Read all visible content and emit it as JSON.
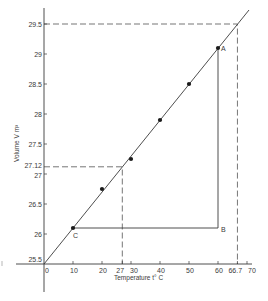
{
  "chart_data": {
    "type": "scatter",
    "title": "",
    "xlabel": "Temperature t° C",
    "ylabel": "Volume V m³",
    "xlim": [
      0,
      70
    ],
    "ylim": [
      25.5,
      29.5
    ],
    "grid": false,
    "legend": null,
    "x_ticks": [
      "0",
      "10",
      "20",
      "27",
      "30",
      "40",
      "50",
      "60",
      "66.7",
      "70"
    ],
    "x_tick_values": [
      0,
      10,
      20,
      27,
      30,
      40,
      50,
      60,
      66.7,
      70
    ],
    "y_ticks": [
      "25.5",
      "26",
      "26.5",
      "27",
      "27.12",
      "27.5",
      "28",
      "28.5",
      "29",
      "29.5"
    ],
    "y_tick_values": [
      25.5,
      26,
      26.5,
      27,
      27.12,
      27.5,
      28,
      28.5,
      29,
      29.5
    ],
    "series": [
      {
        "name": "Measured points",
        "x": [
          10,
          20,
          30,
          40,
          50,
          60
        ],
        "y": [
          26.1,
          26.75,
          27.25,
          27.9,
          28.5,
          29.1
        ]
      },
      {
        "name": "Best-fit line",
        "x": [
          0,
          70
        ],
        "y": [
          25.5,
          29.7
        ]
      }
    ],
    "annotations": [
      {
        "label": "A",
        "x": 60,
        "y": 29.1
      },
      {
        "label": "B",
        "x": 60,
        "y": 26.1
      },
      {
        "label": "C",
        "x": 10,
        "y": 26.1
      },
      {
        "type": "dashed-guide",
        "x": 27,
        "y": 27.12
      },
      {
        "type": "dashed-guide",
        "x": 66.7,
        "y": 29.5
      }
    ]
  },
  "labels": {
    "point_a": "A",
    "point_b": "B",
    "point_c": "C",
    "x_axis_title": "Temperature t° C",
    "y_axis_title": "Volume V m³"
  }
}
